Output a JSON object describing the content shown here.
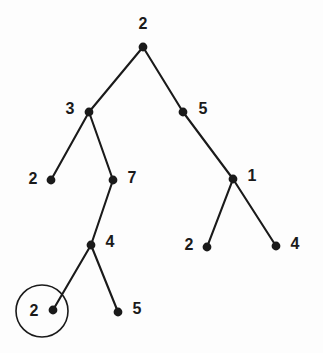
{
  "figure": {
    "name": "binary-tree-diagram",
    "background_color": "#fdfdfd",
    "node_color": "#1a1a1a",
    "edge_color": "#1a1a1a",
    "highlight_color": "#1a1a1a",
    "width": 323,
    "height": 353
  },
  "nodes": [
    {
      "id": "root",
      "label": "2",
      "x": 143,
      "y": 47,
      "label_x": 143,
      "label_y": 25,
      "role": "root",
      "highlighted": false
    },
    {
      "id": "n-left",
      "label": "3",
      "x": 89,
      "y": 112,
      "label_x": 70,
      "label_y": 110,
      "role": "internal",
      "highlighted": false
    },
    {
      "id": "n-right",
      "label": "5",
      "x": 183,
      "y": 112,
      "label_x": 203,
      "label_y": 110,
      "role": "internal",
      "highlighted": false
    },
    {
      "id": "n-left-left",
      "label": "2",
      "x": 51,
      "y": 180,
      "label_x": 33,
      "label_y": 180,
      "role": "leaf",
      "highlighted": false
    },
    {
      "id": "n-left-right",
      "label": "7",
      "x": 113,
      "y": 180,
      "label_x": 132,
      "label_y": 179,
      "role": "internal",
      "highlighted": false
    },
    {
      "id": "n-right-right",
      "label": "1",
      "x": 233,
      "y": 179,
      "label_x": 252,
      "label_y": 177,
      "role": "internal",
      "highlighted": false
    },
    {
      "id": "n-seven-left",
      "label": "4",
      "x": 91,
      "y": 245,
      "label_x": 110,
      "label_y": 243,
      "role": "internal",
      "highlighted": false
    },
    {
      "id": "n-one-left",
      "label": "2",
      "x": 207,
      "y": 247,
      "label_x": 189,
      "label_y": 246,
      "role": "leaf",
      "highlighted": false
    },
    {
      "id": "n-one-right",
      "label": "4",
      "x": 276,
      "y": 246,
      "label_x": 295,
      "label_y": 245,
      "role": "leaf",
      "highlighted": false
    },
    {
      "id": "n-four-left",
      "label": "2",
      "x": 53,
      "y": 310,
      "label_x": 34,
      "label_y": 312,
      "role": "leaf",
      "highlighted": true
    },
    {
      "id": "n-four-right",
      "label": "5",
      "x": 118,
      "y": 312,
      "label_x": 137,
      "label_y": 310,
      "role": "leaf",
      "highlighted": false
    }
  ],
  "edges": [
    {
      "id": "e-root-left",
      "from": "root",
      "to": "n-left",
      "x1": 143,
      "y1": 47,
      "x2": 89,
      "y2": 112
    },
    {
      "id": "e-root-right",
      "from": "root",
      "to": "n-right",
      "x1": 143,
      "y1": 47,
      "x2": 183,
      "y2": 112
    },
    {
      "id": "e-left-leftchild",
      "from": "n-left",
      "to": "n-left-left",
      "x1": 89,
      "y1": 112,
      "x2": 51,
      "y2": 180
    },
    {
      "id": "e-left-rightchild",
      "from": "n-left",
      "to": "n-left-right",
      "x1": 89,
      "y1": 112,
      "x2": 113,
      "y2": 180
    },
    {
      "id": "e-right-rightchild",
      "from": "n-right",
      "to": "n-right-right",
      "x1": 183,
      "y1": 112,
      "x2": 233,
      "y2": 179
    },
    {
      "id": "e-seven-four",
      "from": "n-left-right",
      "to": "n-seven-left",
      "x1": 113,
      "y1": 180,
      "x2": 91,
      "y2": 245
    },
    {
      "id": "e-one-left",
      "from": "n-right-right",
      "to": "n-one-left",
      "x1": 233,
      "y1": 179,
      "x2": 207,
      "y2": 247
    },
    {
      "id": "e-one-right",
      "from": "n-right-right",
      "to": "n-one-right",
      "x1": 233,
      "y1": 179,
      "x2": 276,
      "y2": 246
    },
    {
      "id": "e-four-left",
      "from": "n-seven-left",
      "to": "n-four-left",
      "x1": 91,
      "y1": 245,
      "x2": 53,
      "y2": 310
    },
    {
      "id": "e-four-right",
      "from": "n-seven-left",
      "to": "n-four-right",
      "x1": 91,
      "y1": 245,
      "x2": 118,
      "y2": 312
    }
  ],
  "highlight": {
    "id": "highlight-circle",
    "target_node": "n-four-left",
    "cx": 42,
    "cy": 311,
    "r": 26
  },
  "chart_data": {
    "type": "diagram",
    "diagram_type": "binary-tree",
    "title": "",
    "node_values": [
      "2",
      "3",
      "5",
      "2",
      "7",
      "1",
      "4",
      "2",
      "4",
      "2",
      "5"
    ],
    "structure": {
      "value": "2",
      "children": [
        {
          "value": "3",
          "children": [
            {
              "value": "2",
              "children": []
            },
            {
              "value": "7",
              "children": [
                {
                  "value": "4",
                  "children": [
                    {
                      "value": "2",
                      "children": [],
                      "highlighted": true
                    },
                    {
                      "value": "5",
                      "children": []
                    }
                  ]
                }
              ]
            }
          ]
        },
        {
          "value": "5",
          "children": [
            {
              "value": "1",
              "children": [
                {
                  "value": "2",
                  "children": []
                },
                {
                  "value": "4",
                  "children": []
                }
              ]
            }
          ]
        }
      ]
    },
    "annotations": [
      {
        "type": "circle-highlight",
        "node_value": "2",
        "position": "bottom-left-leaf"
      }
    ]
  }
}
